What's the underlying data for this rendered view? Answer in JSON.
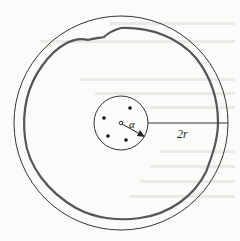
{
  "figure": {
    "labels": {
      "inner_radius": "α",
      "outer_distance": "2r"
    },
    "elements": {
      "outer_circle": "outer boundary circle",
      "wavy_circle": "irregular (wavy) interface circle",
      "inner_circle": "inner circle containing point particles",
      "center_point": "hollow center marker",
      "radius_arrow": "arrow from center to inner circle edge",
      "horizontal_line": "line from inner circle edge to outer circle"
    },
    "colors": {
      "stroke": "#333333",
      "wavy_stroke": "#555555",
      "background": "#fbfbfa"
    }
  }
}
